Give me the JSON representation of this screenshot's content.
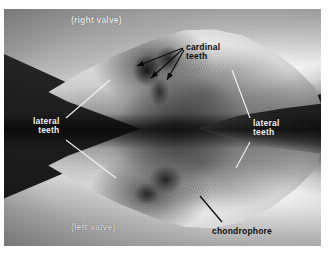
{
  "figure": {
    "kind": "photograph",
    "background_color": "#ffffff",
    "photo_border_color": "#151515"
  },
  "labels": {
    "right_valve": {
      "text": "(right valve)",
      "color": "#e8e8e8",
      "x": 71,
      "y": 16
    },
    "left_valve": {
      "text": "(left valve)",
      "color": "#d2d2d2",
      "x": 71,
      "y": 224
    },
    "cardinal_teeth": {
      "text": "cardinal\nteeth",
      "color": "#0d0d0d",
      "x": 186,
      "y": 44
    },
    "lateral_teeth_left": {
      "text": "lateral\nteeth",
      "color": "#f2f2f2",
      "x": 33,
      "y": 118
    },
    "lateral_teeth_right": {
      "text": "lateral\nteeth",
      "color": "#f2f2f2",
      "x": 253,
      "y": 120
    },
    "chondrophore": {
      "text": "chondrophore",
      "color": "#0d0d0d",
      "x": 212,
      "y": 228
    }
  },
  "leaders": [
    {
      "name": "cardinal-arrow-1",
      "style": "arrow",
      "color": "#0b0b0b",
      "x1": 183,
      "y1": 48,
      "x2": 136,
      "y2": 66
    },
    {
      "name": "cardinal-arrow-2",
      "style": "arrow",
      "color": "#0b0b0b",
      "x1": 183,
      "y1": 49,
      "x2": 150,
      "y2": 78
    },
    {
      "name": "cardinal-arrow-3",
      "style": "arrow",
      "color": "#0b0b0b",
      "x1": 184,
      "y1": 50,
      "x2": 166,
      "y2": 80
    },
    {
      "name": "lateral-left-upper",
      "style": "line",
      "color": "#f2f2f2",
      "x1": 66,
      "y1": 118,
      "x2": 110,
      "y2": 80
    },
    {
      "name": "lateral-left-lower",
      "style": "line",
      "color": "#f2f2f2",
      "x1": 66,
      "y1": 140,
      "x2": 116,
      "y2": 178
    },
    {
      "name": "lateral-right-upper",
      "style": "line",
      "color": "#f2f2f2",
      "x1": 250,
      "y1": 118,
      "x2": 232,
      "y2": 70
    },
    {
      "name": "lateral-right-lower",
      "style": "line",
      "color": "#f2f2f2",
      "x1": 250,
      "y1": 142,
      "x2": 236,
      "y2": 168
    },
    {
      "name": "chondrophore-leader",
      "style": "line",
      "color": "#0b0b0b",
      "x1": 222,
      "y1": 222,
      "x2": 200,
      "y2": 196
    }
  ],
  "photo_frame": {
    "left": 4,
    "top": 9,
    "width": 317,
    "height": 237
  }
}
